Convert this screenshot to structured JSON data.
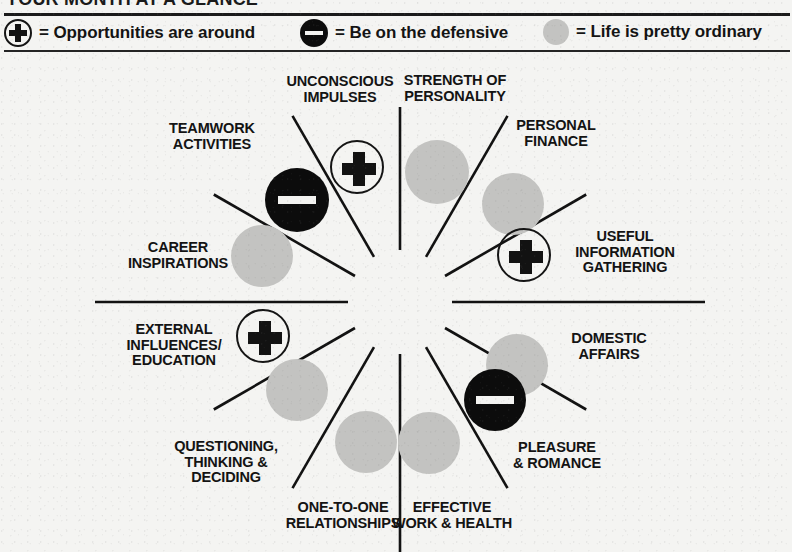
{
  "header": {
    "title": "YOUR MONTH AT A GLANCE",
    "legend": [
      {
        "icon": "plus-circle-icon",
        "text": "= Opportunities are around"
      },
      {
        "icon": "minus-circle-icon",
        "text": "= Be on the defensive"
      },
      {
        "icon": "gray-circle-icon",
        "text": "= Life is pretty ordinary"
      }
    ]
  },
  "colors": {
    "ink": "#121212",
    "paper": "#f4f4f2",
    "gray_circle": "#c3c3c1",
    "minus_fill": "#0c0c0c",
    "minus_bar": "#f3f3f1"
  },
  "wheel": {
    "center_x": 400,
    "center_y": 250,
    "sector_count": 12,
    "sectors": [
      {
        "id": "unconscious-impulses",
        "label": "UNCONSCIOUS\nIMPULSES",
        "symbol": "plus",
        "label_x": 340,
        "label_y": 38,
        "sym_x": 357,
        "sym_y": 115,
        "sym_size": 54
      },
      {
        "id": "strength-of-personality",
        "label": "STRENGTH OF\nPERSONALITY",
        "symbol": "gray",
        "label_x": 455,
        "label_y": 37,
        "sym_x": 437,
        "sym_y": 120,
        "sym_size": 64
      },
      {
        "id": "personal-finance",
        "label": "PERSONAL\nFINANCE",
        "symbol": "gray",
        "label_x": 556,
        "label_y": 82,
        "sym_x": 513,
        "sym_y": 152,
        "sym_size": 62
      },
      {
        "id": "useful-information",
        "label": "USEFUL\nINFORMATION\nGATHERING",
        "symbol": "plus",
        "label_x": 625,
        "label_y": 200,
        "sym_x": 524,
        "sym_y": 203,
        "sym_size": 54
      },
      {
        "id": "domestic-affairs",
        "label": "DOMESTIC\nAFFAIRS",
        "symbol": "gray",
        "label_x": 609,
        "label_y": 295,
        "sym_x": 517,
        "sym_y": 313,
        "sym_size": 62
      },
      {
        "id": "pleasure-romance",
        "label": "PLEASURE\n& ROMANCE",
        "symbol": "minus",
        "label_x": 557,
        "label_y": 404,
        "sym_x": 495,
        "sym_y": 348,
        "sym_size": 62
      },
      {
        "id": "effective-work-health",
        "label": "EFFECTIVE\nWORK & HEALTH",
        "symbol": "gray",
        "label_x": 452,
        "label_y": 464,
        "sym_x": 429,
        "sym_y": 391,
        "sym_size": 62
      },
      {
        "id": "one-to-one",
        "label": "ONE-TO-ONE\nRELATIONSHIPS",
        "symbol": "gray",
        "label_x": 343,
        "label_y": 464,
        "sym_x": 366,
        "sym_y": 390,
        "sym_size": 62
      },
      {
        "id": "questioning-thinking",
        "label": "QUESTIONING,\nTHINKING &\nDECIDING",
        "symbol": "gray",
        "label_x": 226,
        "label_y": 410,
        "sym_x": 297,
        "sym_y": 338,
        "sym_size": 62
      },
      {
        "id": "external-influences",
        "label": "EXTERNAL\nINFLUENCES/\nEDUCATION",
        "symbol": "plus",
        "label_x": 174,
        "label_y": 293,
        "sym_x": 263,
        "sym_y": 284,
        "sym_size": 54
      },
      {
        "id": "career-inspirations",
        "label": "CAREER\nINSPIRATIONS",
        "symbol": "gray",
        "label_x": 178,
        "label_y": 204,
        "sym_x": 262,
        "sym_y": 204,
        "sym_size": 62
      },
      {
        "id": "teamwork-activities",
        "label": "TEAMWORK\nACTIVITIES",
        "symbol": "minus",
        "label_x": 212,
        "label_y": 85,
        "sym_x": 297,
        "sym_y": 148,
        "sym_size": 64
      }
    ],
    "spokes": [
      {
        "angle_deg": -90,
        "inner_r": 52,
        "outer_r": 195
      },
      {
        "angle_deg": -60,
        "inner_r": 52,
        "outer_r": 215
      },
      {
        "angle_deg": -30,
        "inner_r": 52,
        "outer_r": 215
      },
      {
        "angle_deg": 0,
        "inner_r": 52,
        "outer_r": 305
      },
      {
        "angle_deg": 30,
        "inner_r": 52,
        "outer_r": 215
      },
      {
        "angle_deg": 60,
        "inner_r": 52,
        "outer_r": 215
      },
      {
        "angle_deg": 90,
        "inner_r": 52,
        "outer_r": 250
      },
      {
        "angle_deg": 120,
        "inner_r": 52,
        "outer_r": 215
      },
      {
        "angle_deg": 150,
        "inner_r": 52,
        "outer_r": 215
      },
      {
        "angle_deg": 180,
        "inner_r": 52,
        "outer_r": 305
      },
      {
        "angle_deg": 210,
        "inner_r": 52,
        "outer_r": 215
      },
      {
        "angle_deg": 240,
        "inner_r": 52,
        "outer_r": 215
      }
    ]
  }
}
